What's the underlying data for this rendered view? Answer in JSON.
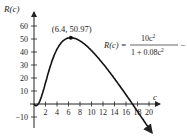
{
  "chart_data": {
    "type": "line",
    "title": "",
    "xlabel": "c",
    "ylabel": "R(c)",
    "function": "R(c) = 10c^2 / (1 + 0.08c^2) - 7c",
    "formula_parts": {
      "lhs": "R(c) =",
      "numerator": "10c",
      "numerator_exp": "2",
      "denominator": "1 + 0.08c",
      "denominator_exp": "2",
      "tail": "− 7c"
    },
    "annotation": {
      "label": "(6.4, 50.97)",
      "x": 6.4,
      "y": 50.97
    },
    "x_ticks": [
      2,
      4,
      6,
      8,
      10,
      12,
      14,
      16,
      18,
      20
    ],
    "x_tick_labels": [
      "2",
      "4",
      "6",
      "8",
      "10",
      "12",
      "14",
      "16",
      "18",
      "20"
    ],
    "y_ticks": [
      -10,
      10,
      20,
      30,
      40,
      50,
      60
    ],
    "y_tick_labels": [
      "−10",
      "10",
      "20",
      "30",
      "40",
      "50",
      "60"
    ],
    "xlim": [
      0,
      21
    ],
    "ylim": [
      -20,
      70
    ],
    "grid": false,
    "series": [
      {
        "name": "R(c)",
        "x": [
          0,
          0.5,
          1,
          2,
          3,
          4,
          5,
          6,
          6.4,
          8,
          10,
          12,
          14,
          16,
          17,
          18,
          19,
          20,
          20.6
        ],
        "values": [
          0,
          -1.05,
          2.26,
          16.3,
          31.3,
          42.2,
          48.3,
          50.8,
          50.97,
          48.6,
          41.1,
          31.0,
          19.5,
          7.2,
          0.8,
          -5.6,
          -12.2,
          -18.9,
          -22.8
        ]
      }
    ]
  }
}
